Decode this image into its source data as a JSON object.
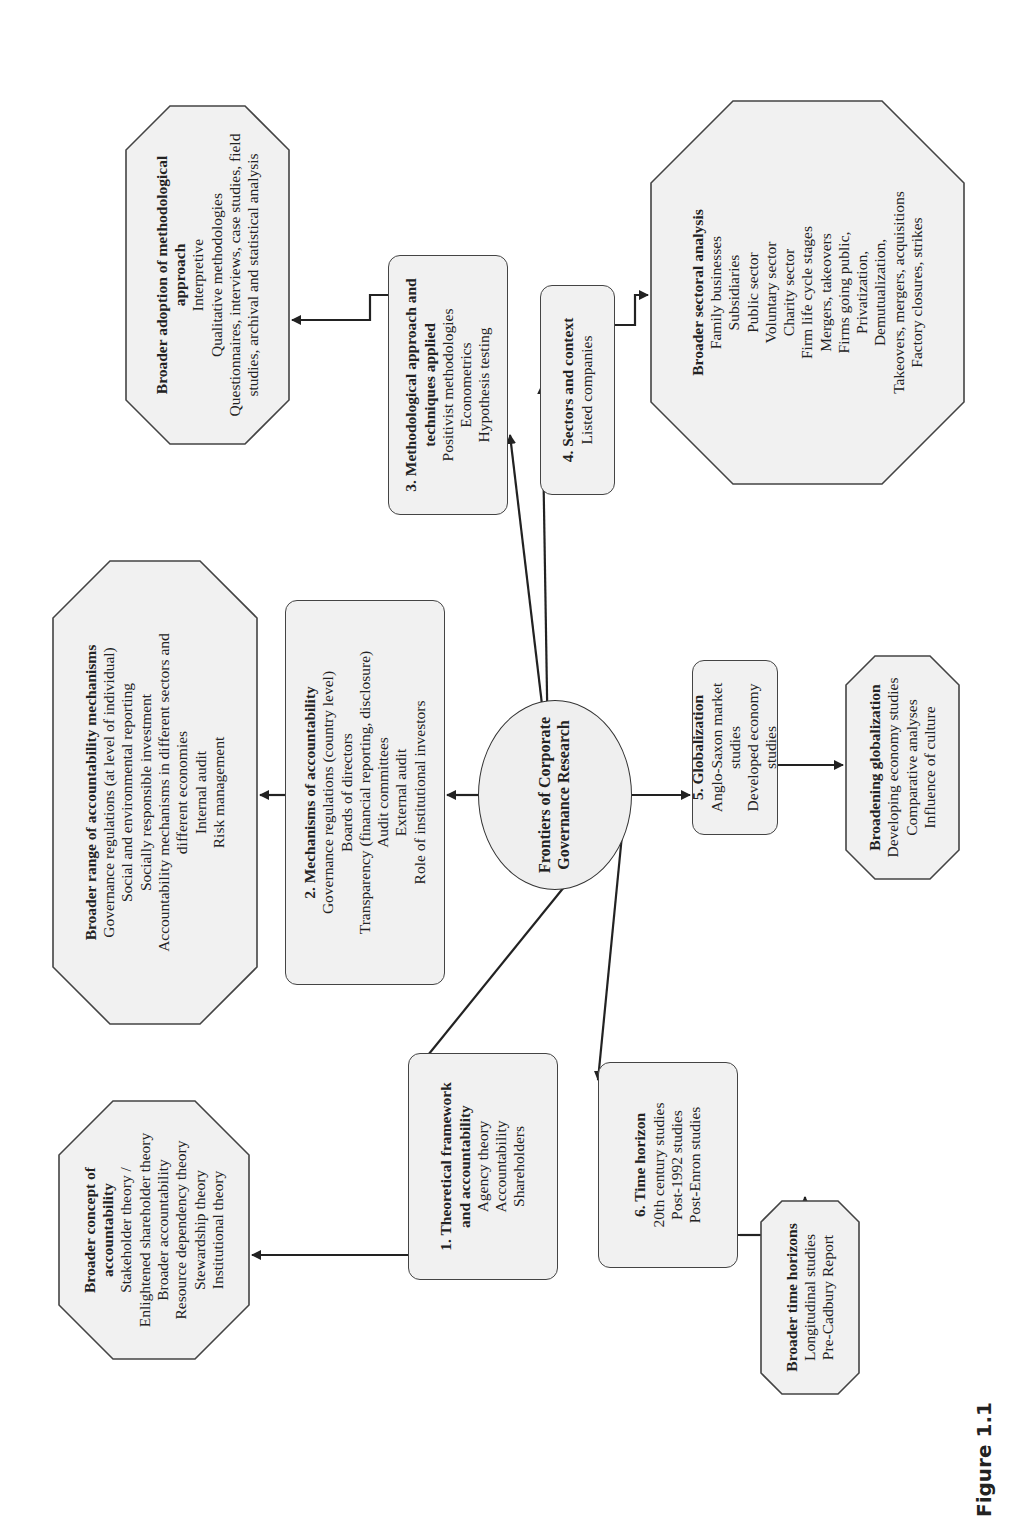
{
  "figure_label": "Figure 1.1",
  "center": {
    "title_line1": "Frontiers of Corporate",
    "title_line2": "Governance Research"
  },
  "nodes": {
    "theoretical": {
      "title": "1. Theoretical framework and accountability",
      "items": [
        "Agency theory",
        "Accountability",
        "Shareholders"
      ]
    },
    "mechanisms": {
      "title": "2. Mechanisms of accountability",
      "items": [
        "Governance regulations (country level)",
        "Boards of directors",
        "Transparency (financial reporting, disclosure)",
        "Audit committees",
        "External audit",
        "Role of institutional investors"
      ]
    },
    "methodological": {
      "title": "3. Methodological approach and techniques applied",
      "items": [
        "Positivist methodologies",
        "Econometrics",
        "Hypothesis testing"
      ]
    },
    "sectors": {
      "title": "4. Sectors and context",
      "items": [
        "Listed companies"
      ]
    },
    "globalization": {
      "title": "5. Globalization",
      "items": [
        "Anglo-Saxon market studies",
        "Developed economy studies"
      ]
    },
    "time_horizon": {
      "title": "6. Time horizon",
      "items": [
        "20th century studies",
        "Post-1992 studies",
        "Post-Enron studies"
      ]
    }
  },
  "broader": {
    "concept_accountability": {
      "title": "Broader concept of accountability",
      "items": [
        "Stakeholder theory /",
        "Enlightened shareholder theory",
        "Broader accountability",
        "Resource dependency theory",
        "Stewardship theory",
        "Institutional theory"
      ]
    },
    "range_mechanisms": {
      "title": "Broader range of accountability mechanisms",
      "items": [
        "Governance regulations (at level of individual)",
        "Social and environmental reporting",
        "Socially responsible investment",
        "Accountability mechanisms in different sectors and",
        "different economies",
        "Internal audit",
        "Risk management"
      ]
    },
    "methodological_approach": {
      "title": "Broader adoption of methodological approach",
      "items": [
        "Interpretive",
        "Qualitative methodologies",
        "Questionnaires, interviews, case studies, field",
        "studies, archival and statistical analysis"
      ]
    },
    "sectoral_analysis": {
      "title": "Broader sectoral analysis",
      "items": [
        "Family businesses",
        "Subsidiaries",
        "Public sector",
        "Voluntary sector",
        "Charity sector",
        "Firm life cycle stages",
        "Mergers, takeovers",
        "Firms going public,",
        "Privatization,",
        "Demutualization,",
        "Takeovers, mergers, acquisitions",
        "Factory closures, strikes"
      ]
    },
    "globalization": {
      "title": "Broadening globalization",
      "items": [
        "Developing economy studies",
        "Comparative analyses",
        "Influence of culture"
      ]
    },
    "time_horizons": {
      "title": "Broader time horizons",
      "items": [
        "Longitudinal studies",
        "Pre-Cadbury Report"
      ]
    }
  },
  "colors": {
    "box_fill": "#f1f1f1",
    "box_stroke": "#444444",
    "arrow": "#222222",
    "text": "#222222"
  }
}
